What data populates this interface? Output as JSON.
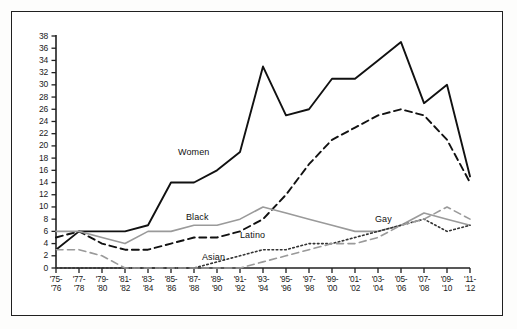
{
  "chart_data": {
    "type": "line",
    "title": "",
    "xlabel": "",
    "ylabel": "",
    "ylim": [
      0,
      38
    ],
    "ytick_step": 2,
    "yticks": [
      0,
      2,
      4,
      6,
      8,
      10,
      12,
      14,
      16,
      18,
      20,
      22,
      24,
      26,
      28,
      30,
      32,
      34,
      36,
      38
    ],
    "grid": false,
    "legend": "inline-labels",
    "categories": [
      "'75-'76",
      "'77-'78",
      "'79-'80",
      "'81-'82",
      "'83-'84",
      "'85-'86",
      "'87-'88",
      "'89-'90",
      "'91-'92",
      "'93-'94",
      "'95-'96",
      "'97-'98",
      "'99-'00",
      "'01-'02",
      "'03-'04",
      "'05-'06",
      "'07-'08",
      "'09-'10",
      "'11-'12"
    ],
    "categories_line1": [
      "'75-",
      "'77-",
      "'79-",
      "'81-",
      "'83-",
      "'85-",
      "'87-",
      "'89-",
      "'91-",
      "'93-",
      "'95-",
      "'97-",
      "'99-",
      "'01-",
      "'03-",
      "'05-",
      "'07-",
      "'09-",
      "'11-"
    ],
    "categories_line2": [
      "'76",
      "'78",
      "'80",
      "'82",
      "'84",
      "'86",
      "'88",
      "'90",
      "'92",
      "'94",
      "'96",
      "'98",
      "'00",
      "'02",
      "'04",
      "'06",
      "'08",
      "'10",
      "'12"
    ],
    "series": [
      {
        "name": "Women",
        "style": "solid",
        "color": "#111111",
        "width": 1.9,
        "values": [
          3,
          6,
          6,
          6,
          7,
          14,
          14,
          16,
          19,
          33,
          25,
          26,
          31,
          31,
          34,
          37,
          27,
          30,
          15
        ]
      },
      {
        "name": "Latino",
        "style": "dashed",
        "color": "#111111",
        "width": 1.9,
        "values": [
          5,
          6,
          4,
          3,
          3,
          4,
          5,
          5,
          6,
          8,
          12,
          17,
          21,
          23,
          25,
          26,
          25,
          21,
          14
        ]
      },
      {
        "name": "Black",
        "style": "solid",
        "color": "#9a9a9a",
        "width": 1.6,
        "values": [
          6,
          6,
          5,
          4,
          6,
          6,
          7,
          7,
          8,
          10,
          9,
          8,
          7,
          6,
          6,
          7,
          9,
          8,
          7
        ]
      },
      {
        "name": "Gay",
        "style": "dotted",
        "color": "#333333",
        "width": 1.6,
        "values": [
          0,
          0,
          0,
          0,
          0,
          0,
          0,
          1,
          2,
          3,
          3,
          4,
          4,
          5,
          6,
          7,
          8,
          6,
          7
        ]
      },
      {
        "name": "Asian",
        "style": "dashed",
        "color": "#9a9a9a",
        "width": 1.6,
        "values": [
          3,
          3,
          2,
          0,
          0,
          0,
          0,
          0,
          0,
          1,
          2,
          3,
          4,
          4,
          5,
          7,
          8,
          10,
          8
        ]
      }
    ],
    "series_label_positions": [
      {
        "name": "Women",
        "x": 178,
        "y": 148
      },
      {
        "name": "Black",
        "x": 186,
        "y": 213
      },
      {
        "name": "Latino",
        "x": 240,
        "y": 231
      },
      {
        "name": "Gay",
        "x": 375,
        "y": 215
      },
      {
        "name": "Asian",
        "x": 202,
        "y": 253
      }
    ]
  },
  "axes": {
    "x0": 56,
    "x1": 470,
    "y0": 268,
    "ytop": 36
  }
}
